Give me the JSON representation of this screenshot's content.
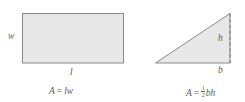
{
  "figure": {
    "kind": "geometry-area-formulas",
    "background_color": "#ffffff",
    "shape_fill_color": "#e8e8e8",
    "shape_stroke_color": "#8a8a8a",
    "text_color": "#5a5a5a"
  },
  "rectangle": {
    "name": "rectangle",
    "width_label": "w",
    "length_label": "l",
    "formula": {
      "area_symbol": "A",
      "equals": "=",
      "expression": "lw",
      "factor_1": "l",
      "factor_2": "w",
      "full_text": "A = lw"
    }
  },
  "triangle": {
    "name": "triangle",
    "height_label": "h",
    "base_label": "b",
    "height_line_style": "dashed",
    "formula": {
      "area_symbol": "A",
      "equals": "=",
      "coefficient_numerator": "1",
      "coefficient_denominator": "2",
      "expression": "bh",
      "factor_1": "b",
      "factor_2": "h",
      "full_text": "A = 1/2 bh"
    }
  }
}
